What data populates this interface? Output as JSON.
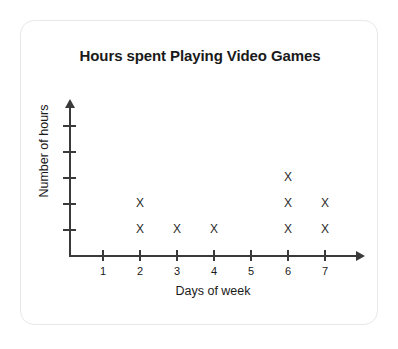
{
  "card": {
    "border_color": "#e8e8e8",
    "background": "#ffffff"
  },
  "chart_data": {
    "type": "scatter",
    "plot_style": "dot-plot",
    "marker": "X",
    "title": "Hours spent Playing Video Games",
    "xlabel": "Days of week",
    "ylabel": "Number of hours",
    "categories": [
      "1",
      "2",
      "3",
      "4",
      "5",
      "6",
      "7"
    ],
    "x": [
      1,
      2,
      3,
      4,
      5,
      6,
      7
    ],
    "values": [
      0,
      2,
      1,
      1,
      0,
      3,
      2
    ],
    "x_tick_labels": [
      "1",
      "2",
      "3",
      "4",
      "5",
      "6",
      "7"
    ],
    "y_tick_labels": [
      "",
      "",
      "",
      "",
      ""
    ],
    "y_tick_count": 5,
    "xlim": [
      0.5,
      7.5
    ],
    "ylim": [
      0,
      5
    ],
    "grid": false,
    "legend": false,
    "axis_color": "#3a3a3a",
    "marker_color": "#2b2b2b",
    "points": [
      {
        "day": 2,
        "stack": 1
      },
      {
        "day": 2,
        "stack": 2
      },
      {
        "day": 3,
        "stack": 1
      },
      {
        "day": 4,
        "stack": 1
      },
      {
        "day": 6,
        "stack": 1
      },
      {
        "day": 6,
        "stack": 2
      },
      {
        "day": 6,
        "stack": 3
      },
      {
        "day": 7,
        "stack": 1
      },
      {
        "day": 7,
        "stack": 2
      }
    ]
  }
}
